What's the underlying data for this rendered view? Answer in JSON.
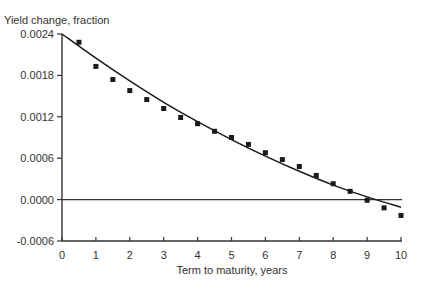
{
  "chart_data": {
    "type": "scatter",
    "title": "",
    "ylabel": "Yield change, fraction",
    "xlabel": "Term to maturity, years",
    "xlim": [
      0,
      10
    ],
    "ylim": [
      -0.0006,
      0.0024
    ],
    "x_ticks": [
      "0",
      "1",
      "2",
      "3",
      "4",
      "5",
      "6",
      "7",
      "8",
      "9",
      "10"
    ],
    "y_ticks": [
      "0.0024",
      "0.0018",
      "0.0012",
      "0.0006",
      "0.0000",
      "-0.0006"
    ],
    "y_tick_values": [
      0.0024,
      0.0018,
      0.0012,
      0.0006,
      0.0,
      -0.0006
    ],
    "grid": false,
    "legend": null,
    "zero_line": true,
    "series": [
      {
        "name": "Observed",
        "type": "scatter",
        "marker": "square",
        "x": [
          0.5,
          1,
          1.5,
          2,
          2.5,
          3,
          3.5,
          4,
          4.5,
          5,
          5.5,
          6,
          6.5,
          7,
          7.5,
          8,
          8.5,
          9,
          9.5,
          10
        ],
        "values": [
          0.00228,
          0.00193,
          0.00174,
          0.00158,
          0.00145,
          0.00132,
          0.00119,
          0.0011,
          0.00099,
          0.0009,
          0.0008,
          0.00068,
          0.00058,
          0.00048,
          0.00035,
          0.00023,
          0.00012,
          -1e-05,
          -0.00012,
          -0.00023
        ]
      },
      {
        "name": "Fitted curve",
        "type": "line",
        "x": [
          0,
          1,
          2,
          3,
          4,
          5,
          6,
          7,
          8,
          9,
          10
        ],
        "values": [
          0.0024,
          0.00205,
          0.00172,
          0.00141,
          0.00113,
          0.00087,
          0.00063,
          0.00041,
          0.00021,
          4e-05,
          -0.00011
        ]
      }
    ]
  },
  "colors": {
    "axis": "#333333",
    "marker": "#1a1a1a",
    "curve": "#1a1a1a",
    "background": "#ffffff"
  }
}
